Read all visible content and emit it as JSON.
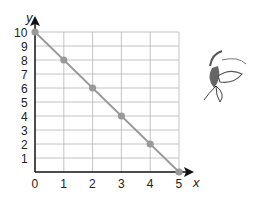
{
  "chart_data": {
    "type": "line",
    "title": "",
    "xlabel": "x",
    "ylabel": "y",
    "xlim": [
      0,
      5
    ],
    "ylim": [
      0,
      10
    ],
    "grid": true,
    "x_ticks": [
      "0",
      "1",
      "2",
      "3",
      "4",
      "5"
    ],
    "y_ticks": [
      "1",
      "2",
      "3",
      "4",
      "5",
      "6",
      "7",
      "8",
      "9",
      "10"
    ],
    "series": [
      {
        "name": "line",
        "x": [
          0,
          1,
          2,
          3,
          4,
          5
        ],
        "y": [
          10,
          8,
          6,
          4,
          2,
          0
        ],
        "color": "#999999"
      }
    ]
  },
  "decoration": {
    "icon": "plant-sprout-sketch"
  }
}
